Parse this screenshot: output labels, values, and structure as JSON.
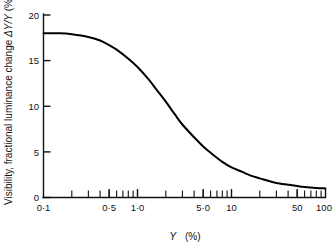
{
  "chart_data": {
    "type": "line",
    "title": "",
    "xlabel": "Y (%)",
    "ylabel": "Visibility, fractional luminance change ΔY/Y (%)",
    "xscale": "log",
    "yscale": "linear",
    "xlim": [
      0.1,
      100
    ],
    "ylim": [
      0,
      20
    ],
    "grid": false,
    "legend": null,
    "x_tick_labels": [
      "0·1",
      "0·5",
      "1·0",
      "5·0",
      "10",
      "50",
      "100"
    ],
    "x_tick_values": [
      0.1,
      0.5,
      1.0,
      5.0,
      10,
      50,
      100
    ],
    "x_minor_ticks": [
      0.2,
      0.3,
      0.4,
      0.5,
      0.6,
      0.7,
      0.8,
      0.9,
      2,
      3,
      4,
      5,
      6,
      7,
      8,
      9,
      20,
      30,
      40,
      50,
      60,
      70,
      80,
      90
    ],
    "y_tick_labels": [
      "0",
      "5",
      "10",
      "15",
      "20"
    ],
    "y_tick_values": [
      0,
      5,
      10,
      15,
      20
    ],
    "series": [
      {
        "name": "visibility threshold",
        "x": [
          0.1,
          0.15,
          0.2,
          0.3,
          0.4,
          0.5,
          0.6,
          0.8,
          1.0,
          1.3,
          1.6,
          2.0,
          2.5,
          3.0,
          4.0,
          5.0,
          6.0,
          8.0,
          10.0,
          13.0,
          16.0,
          20.0,
          25.0,
          30.0,
          40.0,
          50.0,
          60.0,
          80.0,
          100.0
        ],
        "y": [
          18.0,
          18.0,
          17.9,
          17.6,
          17.2,
          16.7,
          16.2,
          15.2,
          14.3,
          13.0,
          11.8,
          10.5,
          9.1,
          8.0,
          6.6,
          5.6,
          4.9,
          3.9,
          3.3,
          2.8,
          2.4,
          2.1,
          1.8,
          1.6,
          1.4,
          1.25,
          1.15,
          1.05,
          1.0
        ]
      }
    ],
    "annotations": []
  },
  "axes": {
    "x_title": "Y  (%)",
    "x_title_var": "Y",
    "x_title_unit": "(%)",
    "y_title": "Visibility, fractional luminance change ΔY/Y (%)",
    "y_title_part1": "Visibility, fractional luminance change ",
    "y_title_delta": "ΔY/Y",
    "y_title_part2": " (%)"
  },
  "colors": {
    "curve": "#000000",
    "axis": "#111111",
    "background": "#ffffff"
  }
}
